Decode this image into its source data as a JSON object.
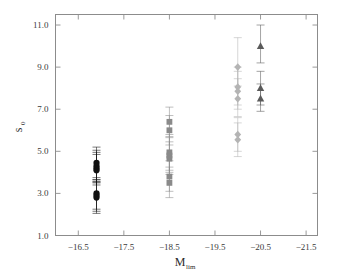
{
  "figure": {
    "title": "",
    "background": "#ffffff",
    "frame_color": "#8c8c8c"
  },
  "axes": {
    "y_title": "s",
    "y_title_sub": "0",
    "x_title": "M",
    "x_title_sub": "lim",
    "y_ticks": [
      "1.0",
      "3.0",
      "5.0",
      "7.0",
      "9.0",
      "11.0"
    ],
    "x_ticks": [
      "−16.5",
      "−17.5",
      "−18.5",
      "−19.5",
      "−20.5",
      "−21.5"
    ]
  },
  "chart_data": {
    "type": "scatter",
    "title": "",
    "xlabel": "M_lim",
    "ylabel": "s_0",
    "xlim": [
      -16.0,
      -21.75
    ],
    "ylim": [
      1.0,
      11.5
    ],
    "x_tick_values": [
      -16.5,
      -17.5,
      -18.5,
      -19.5,
      -20.5,
      -21.5
    ],
    "y_tick_values": [
      1.0,
      3.0,
      5.0,
      7.0,
      9.0,
      11.0
    ],
    "grid": false,
    "legend": "none",
    "x_axis_direction": "decreasing",
    "series": [
      {
        "name": "circles",
        "marker": "circle",
        "color": "#111111",
        "x": -16.9,
        "points": [
          {
            "y": 4.45,
            "yerr_low": 3.65,
            "yerr_high": 5.2
          },
          {
            "y": 4.3,
            "yerr_low": 3.55,
            "yerr_high": 5.05
          },
          {
            "y": 4.2,
            "yerr_low": 3.5,
            "yerr_high": 4.95
          },
          {
            "y": 4.1,
            "yerr_low": 3.4,
            "yerr_high": 4.85
          },
          {
            "y": 3.0,
            "yerr_low": 2.25,
            "yerr_high": 3.75
          },
          {
            "y": 2.9,
            "yerr_low": 2.15,
            "yerr_high": 3.65
          },
          {
            "y": 2.8,
            "yerr_low": 2.05,
            "yerr_high": 3.55
          }
        ]
      },
      {
        "name": "squares",
        "marker": "square",
        "color": "#8a8a8a",
        "x": -18.5,
        "points": [
          {
            "y": 6.4,
            "yerr_low": 5.7,
            "yerr_high": 7.1
          },
          {
            "y": 6.0,
            "yerr_low": 5.3,
            "yerr_high": 6.7
          },
          {
            "y": 4.95,
            "yerr_low": 4.1,
            "yerr_high": 5.8
          },
          {
            "y": 4.8,
            "yerr_low": 4.0,
            "yerr_high": 5.65
          },
          {
            "y": 4.65,
            "yerr_low": 3.9,
            "yerr_high": 5.45
          },
          {
            "y": 3.8,
            "yerr_low": 3.1,
            "yerr_high": 4.55
          },
          {
            "y": 3.5,
            "yerr_low": 2.8,
            "yerr_high": 4.25
          }
        ]
      },
      {
        "name": "diamonds",
        "marker": "diamond",
        "color": "#b4b4b4",
        "x": -20.0,
        "points": [
          {
            "y": 9.0,
            "yerr_low": 8.1,
            "yerr_high": 10.4
          },
          {
            "y": 8.05,
            "yerr_low": 7.2,
            "yerr_high": 9.0
          },
          {
            "y": 7.85,
            "yerr_low": 7.0,
            "yerr_high": 8.8
          },
          {
            "y": 7.5,
            "yerr_low": 6.65,
            "yerr_high": 8.45
          },
          {
            "y": 5.8,
            "yerr_low": 5.0,
            "yerr_high": 6.6
          },
          {
            "y": 5.55,
            "yerr_low": 4.75,
            "yerr_high": 6.35
          }
        ]
      },
      {
        "name": "triangles",
        "marker": "triangle",
        "color": "#5a5a5a",
        "x": -20.5,
        "points": [
          {
            "y": 10.0,
            "yerr_low": 9.2,
            "yerr_high": 11.0
          },
          {
            "y": 8.0,
            "yerr_low": 7.2,
            "yerr_high": 8.8
          },
          {
            "y": 7.5,
            "yerr_low": 6.9,
            "yerr_high": 8.2
          }
        ]
      }
    ]
  }
}
